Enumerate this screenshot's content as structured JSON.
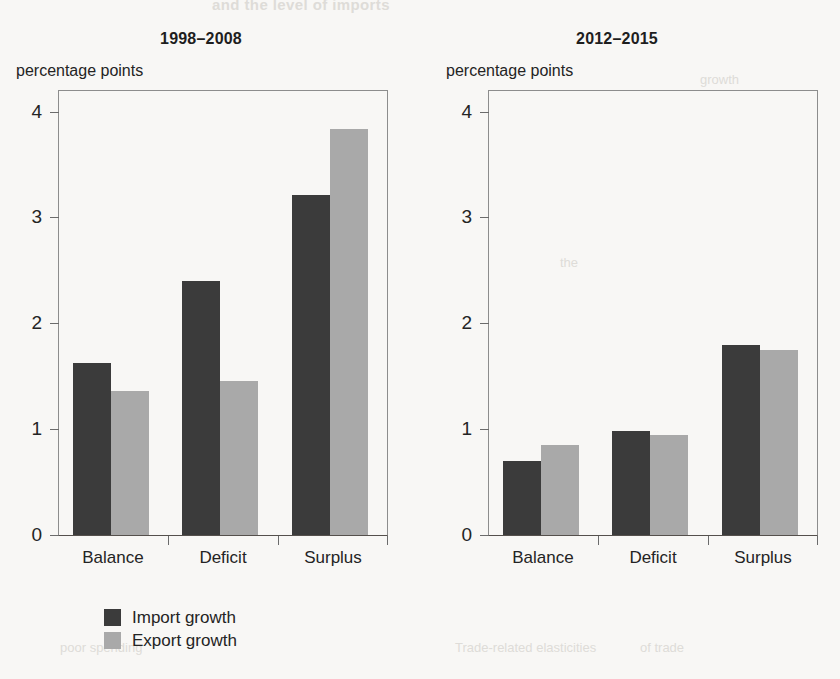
{
  "figure": {
    "cut_off_header": "and the level of imports",
    "axis_unit_label": "percentage points"
  },
  "legend": {
    "position": "below-left-panel",
    "entries": [
      {
        "label": "Import growth",
        "color": "#3b3b3b",
        "key": "import"
      },
      {
        "label": "Export growth",
        "color": "#a9a9a9",
        "key": "export"
      }
    ]
  },
  "scanner_bleed": {
    "top": "and the level of imports",
    "right_upper": "growth",
    "right_mid": "the",
    "bottom_left": "poor spending",
    "bottom_center": "Trade-related elasticities",
    "bottom_right": "of trade"
  },
  "chart_data": [
    {
      "type": "bar",
      "title": "1998–2008",
      "panel_index": 0,
      "xlabel": "",
      "ylabel": "percentage points",
      "categories": [
        "Balance",
        "Deficit",
        "Surplus"
      ],
      "series": [
        {
          "name": "Import growth",
          "color": "#3b3b3b",
          "values": [
            1.63,
            2.4,
            3.22
          ]
        },
        {
          "name": "Export growth",
          "color": "#a9a9a9",
          "values": [
            1.36,
            1.46,
            3.84
          ]
        }
      ],
      "yticks": [
        0,
        1,
        2,
        3,
        4
      ],
      "ylim": [
        0,
        4.2
      ],
      "grid": false,
      "legend_position": "bottom-left"
    },
    {
      "type": "bar",
      "title": "2012–2015",
      "panel_index": 1,
      "xlabel": "",
      "ylabel": "percentage points",
      "categories": [
        "Balance",
        "Deficit",
        "Surplus"
      ],
      "series": [
        {
          "name": "Import growth",
          "color": "#3b3b3b",
          "values": [
            0.7,
            0.98,
            1.8
          ]
        },
        {
          "name": "Export growth",
          "color": "#a9a9a9",
          "values": [
            0.85,
            0.95,
            1.75
          ]
        }
      ],
      "yticks": [
        0,
        1,
        2,
        3,
        4
      ],
      "ylim": [
        0,
        4.2
      ],
      "grid": false,
      "legend_position": "none"
    }
  ]
}
